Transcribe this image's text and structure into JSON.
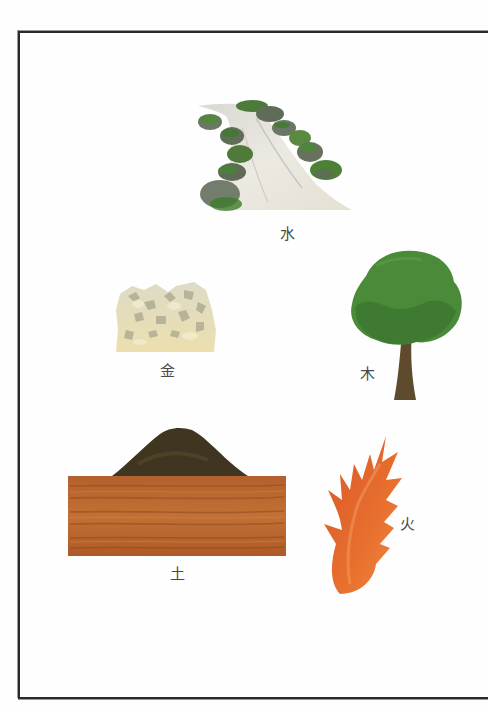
{
  "page": {
    "background": "#fefefe",
    "frame_color": "#2a2a2a"
  },
  "elements": [
    {
      "key": "water",
      "character": "水",
      "icon": "waterfall-with-mossy-rocks-icon",
      "colors": {
        "water": "#e6e3db",
        "rock": "#6f7a68",
        "moss": "#4f8a34"
      }
    },
    {
      "key": "metal",
      "character": "金",
      "icon": "ore-rock-icon",
      "colors": {
        "base": "#e5dcb6",
        "shade": "#a9a58d"
      }
    },
    {
      "key": "wood",
      "character": "木",
      "icon": "tree-icon",
      "colors": {
        "canopy": "#4a8a38",
        "canopy_dark": "#2f6a2a",
        "trunk": "#5e4a2c"
      }
    },
    {
      "key": "earth",
      "character": "土",
      "icon": "soil-mound-and-ground-icon",
      "colors": {
        "mound": "#3f3520",
        "ground": "#b8622d",
        "ground_dark": "#8f4a22"
      }
    },
    {
      "key": "fire",
      "character": "火",
      "icon": "flame-icon",
      "colors": {
        "flame": "#e0652a",
        "flame_light": "#f08a4a"
      }
    }
  ]
}
